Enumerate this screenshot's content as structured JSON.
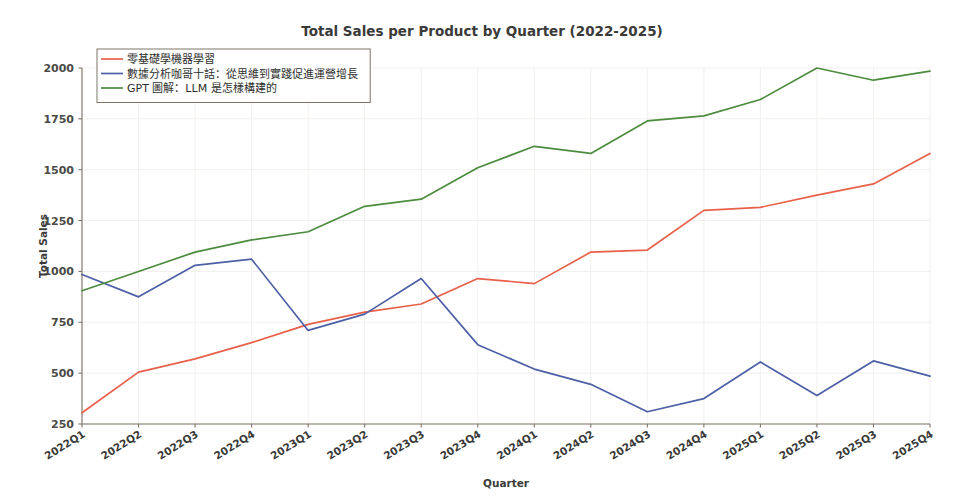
{
  "chart_data": {
    "type": "line",
    "title": "Total Sales per Product by Quarter (2022-2025)",
    "xlabel": "Quarter",
    "ylabel": "Total Sales",
    "categories": [
      "2022Q1",
      "2022Q2",
      "2022Q3",
      "2022Q4",
      "2023Q1",
      "2023Q2",
      "2023Q3",
      "2023Q4",
      "2024Q1",
      "2024Q2",
      "2024Q3",
      "2024Q4",
      "2025Q1",
      "2025Q2",
      "2025Q3",
      "2025Q4"
    ],
    "ylim": [
      230,
      2060
    ],
    "yticks": [
      250,
      500,
      750,
      1000,
      1250,
      1500,
      1750,
      2000
    ],
    "ytick_labels": [
      "250",
      "500",
      "750",
      "1000",
      "1250",
      "1500",
      "1750",
      "2000"
    ],
    "grid": true,
    "legend_position": "upper left",
    "series": [
      {
        "name": "零基礎學機器學習",
        "color": "#E8604A",
        "values": [
          305,
          505,
          570,
          650,
          740,
          800,
          840,
          965,
          940,
          1095,
          1105,
          1300,
          1315,
          1375,
          1430,
          1580
        ]
      },
      {
        "name": "數據分析咖哥十話：從思維到實踐促進運營增長",
        "color": "#4D5FA6",
        "values": [
          985,
          875,
          1030,
          1060,
          710,
          790,
          965,
          640,
          520,
          445,
          310,
          375,
          555,
          390,
          560,
          485
        ]
      },
      {
        "name": "GPT 圖解：LLM 是怎樣構建的",
        "color": "#4C8C3E",
        "values": [
          905,
          1000,
          1095,
          1155,
          1195,
          1320,
          1355,
          1510,
          1615,
          1580,
          1740,
          1765,
          1845,
          2000,
          1940,
          1985
        ]
      }
    ]
  },
  "figure": {
    "background": "#ffffff",
    "axis_color": "#7d7568",
    "grid_color": "#f0eeec"
  }
}
